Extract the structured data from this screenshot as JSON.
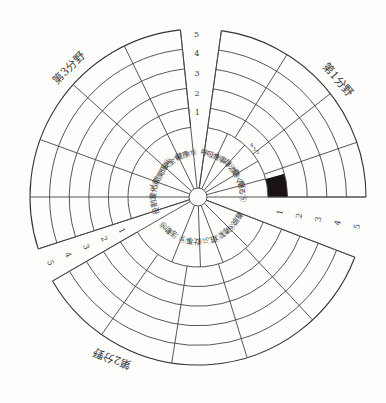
{
  "diagram": {
    "center": [
      198,
      197
    ],
    "inner_radius": 9,
    "label_ring_radius": 70,
    "ring_step": 19.6,
    "score_levels": 5,
    "colors": {
      "line": "#444444",
      "fill": "#1a1214",
      "background": "#fdfdfb",
      "text": "#3a3a3a"
    }
  },
  "scales": [
    {
      "name": "top-scale",
      "from": -96,
      "to": -82,
      "label_angle": -90.5,
      "ticks": [
        "1",
        "2",
        "3",
        "4",
        "5"
      ]
    },
    {
      "name": "right-scale",
      "from": 0,
      "to": 21,
      "label_angle": 21,
      "ticks": [
        "1",
        "2",
        "3",
        "4",
        "5"
      ]
    },
    {
      "name": "left-scale",
      "from": 150,
      "to": 162,
      "label_angle": 162,
      "ticks": [
        "1",
        "2",
        "3",
        "4",
        "5"
      ]
    }
  ],
  "sectors": [
    {
      "title": "第1分野",
      "from": -82,
      "to": 0,
      "title_angle": -40,
      "title_rotate": 48,
      "outer_spokes": [
        -82,
        -58,
        -38,
        -19,
        0
      ],
      "items": [
        {
          "no": "①",
          "label": "呼吸",
          "from": -82,
          "to": -65
        },
        {
          "no": "②",
          "label": "食事",
          "from": -65,
          "to": -48
        },
        {
          "no": "③",
          "label": "排泄",
          "from": -48,
          "to": -31
        },
        {
          "no": "④",
          "label": "動く",
          "from": -31,
          "to": -15
        },
        {
          "no": "⑤",
          "label": "眠る",
          "from": -15,
          "to": 0
        }
      ],
      "annotation": {
        "text": [
          "4",
          "1",
          "3"
        ],
        "angle": -40
      }
    },
    {
      "title": "第2分野",
      "from": 21,
      "to": 150,
      "title_angle": 118,
      "title_rotate": 200,
      "outer_spokes": [
        21,
        47,
        73,
        99,
        125,
        150
      ],
      "items": [
        {
          "no": "⑥",
          "label": "着脱",
          "from": 21,
          "to": 45
        },
        {
          "no": "⑦",
          "label": "清潔",
          "from": 45,
          "to": 69
        },
        {
          "no": "⑧",
          "label": "遊ぶ",
          "from": 69,
          "to": 88
        },
        {
          "no": "⑨",
          "label": "仕事",
          "from": 88,
          "to": 112
        },
        {
          "no": "⑩",
          "label": "活動",
          "from": 112,
          "to": 150
        }
      ]
    },
    {
      "title": "第3分野",
      "from": 162,
      "to": 264,
      "title_angle": -135,
      "title_rotate": -45,
      "outer_spokes": [
        162,
        180,
        200,
        222,
        244,
        264
      ],
      "items": [
        {
          "no": "⑪",
          "label": "役割",
          "from": 162,
          "to": 180
        },
        {
          "no": "⑫",
          "label": "変化",
          "from": 180,
          "to": 200
        },
        {
          "no": "⑬",
          "label": "人間関係",
          "from": 200,
          "to": 222
        },
        {
          "no": "⑭",
          "label": "安全",
          "from": 222,
          "to": 244
        },
        {
          "no": "⑮",
          "label": "健康",
          "from": 244,
          "to": 264
        }
      ]
    }
  ],
  "filled_cells": [
    {
      "sector": 0,
      "from": -15,
      "to": 0,
      "level_from": 0,
      "level_to": 1
    }
  ],
  "chart_data": {
    "type": "radial-grid",
    "title": "",
    "sectors": [
      "第1分野",
      "第2分野",
      "第3分野"
    ],
    "categories": [
      "①呼吸",
      "②食事",
      "③排泄",
      "④動く",
      "⑤眠る",
      "⑥着脱",
      "⑦清潔",
      "⑧遊ぶ",
      "⑨仕事",
      "⑩活動",
      "⑪役割",
      "⑫変化",
      "⑬人間関係",
      "⑭安全",
      "⑮健康"
    ],
    "scale": [
      1,
      2,
      3,
      4,
      5
    ],
    "values": [
      null,
      null,
      null,
      1,
      null,
      null,
      null,
      null,
      null,
      null,
      null,
      null,
      null,
      null,
      null
    ],
    "note": "Only one cell is filled (level 1, between items ④ and ⑤ band near 0°); all other cells are empty."
  }
}
